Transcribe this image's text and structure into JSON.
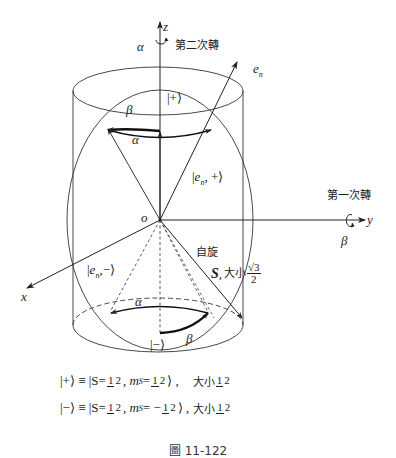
{
  "diagram": {
    "axes": {
      "z_label": "z",
      "y_label": "y",
      "x_label": "x",
      "origin_label": "o",
      "en_label": "e",
      "en_sub": "n"
    },
    "rotations": {
      "second": {
        "symbol": "α",
        "text": "第二次轉"
      },
      "first": {
        "symbol": "β",
        "text": "第一次轉"
      }
    },
    "top_cap": {
      "ket_plus": "|+⟩",
      "beta": "β",
      "alpha": "α"
    },
    "en_plus_ket": {
      "open": "|",
      "e": "e",
      "sub": "n",
      "rest": ", +⟩"
    },
    "en_minus_ket": {
      "open": "|",
      "e": "e",
      "sub": "n",
      "rest": ",−⟩"
    },
    "spin": {
      "line1": "自旋",
      "S": "S",
      "comma": ",",
      "size_text": "大小",
      "num": "√3",
      "den": "2"
    },
    "bottom_cap": {
      "alpha": "α",
      "beta": "β",
      "ket_minus": "|−⟩"
    }
  },
  "equations": [
    {
      "ket": "|+⟩ ≡ |S=",
      "f1_num": "1",
      "f1_den": "2",
      "mid": ", m",
      "sub": "S",
      "eq2": "=",
      "f2_num": "1",
      "f2_den": "2",
      "close": "⟩ ,",
      "size_text": "大小",
      "f3_num": "1",
      "f3_den": "2"
    },
    {
      "ket": "|−⟩ ≡ |S=",
      "f1_num": "1",
      "f1_den": "2",
      "mid": ", m",
      "sub": "S",
      "eq2": "= −",
      "f2_num": "1",
      "f2_den": "2",
      "close": "⟩ ,",
      "size_text": "大小",
      "f3_num": "1",
      "f3_den": "2"
    }
  ],
  "caption": "圖 11-122",
  "colors": {
    "line": "#222222",
    "background": "#ffffff"
  }
}
